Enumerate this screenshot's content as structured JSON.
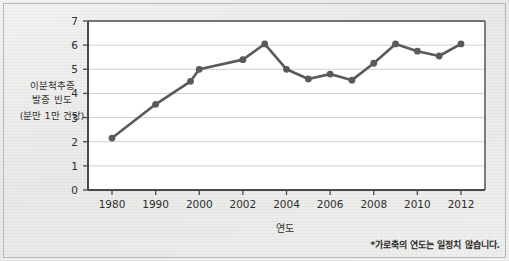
{
  "figure": {
    "background_color": "#ececea",
    "border_color": "#b9b9b6"
  },
  "chart_data": {
    "type": "line",
    "title": "",
    "subtitle": "",
    "xlabel": "연도",
    "ylabel": "이분척추증 발증 빈도 (분만 1만 건당)",
    "ylabel_lines": [
      "이분척추증",
      "발증 빈도",
      "(분만 1만 건당)"
    ],
    "ylim": [
      0,
      7
    ],
    "y_ticks": [
      0,
      1,
      2,
      3,
      4,
      5,
      6,
      7
    ],
    "y_tick_labels": [
      "0",
      "1",
      "2",
      "3",
      "4",
      "5",
      "6",
      "7"
    ],
    "x_tick_labels": [
      "1980",
      "1990",
      "2000",
      "2002",
      "2004",
      "2006",
      "2008",
      "2010",
      "2012"
    ],
    "x_categories": [
      "1980",
      "1990",
      "1998",
      "2000",
      "2002",
      "2003",
      "2004",
      "2005",
      "2006",
      "2007",
      "2008",
      "2009",
      "2010",
      "2011",
      "2012"
    ],
    "values": [
      2.15,
      3.55,
      4.5,
      5.0,
      5.4,
      6.05,
      5.0,
      4.6,
      4.8,
      4.55,
      5.25,
      6.05,
      5.75,
      5.55,
      6.05
    ],
    "grid": "horizontal",
    "legend": "none",
    "line_color": "#5a5a5a",
    "marker_color": "#5a5a5a",
    "marker_shape": "circle",
    "axis_color": "#4a4a4a",
    "gridline_color": "#cfcfcf",
    "plot_background": "#ffffff",
    "note": "*가로축의 연도는 일정치 않습니다."
  },
  "footnote": {
    "text": "*가로축의 연도는 일정치 않습니다."
  },
  "axes": {
    "x_title": "연도"
  }
}
